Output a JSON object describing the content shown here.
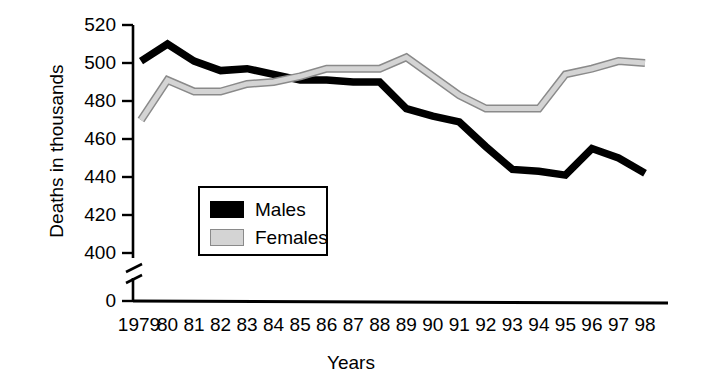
{
  "chart_data": {
    "type": "line",
    "title": "",
    "xlabel": "Years",
    "ylabel": "Deaths in thousands",
    "categories": [
      "1979",
      "80",
      "81",
      "82",
      "83",
      "84",
      "85",
      "86",
      "87",
      "88",
      "89",
      "90",
      "91",
      "92",
      "93",
      "94",
      "95",
      "96",
      "97",
      "98"
    ],
    "yticks": [
      "520",
      "500",
      "480",
      "460",
      "440",
      "420",
      "400",
      "0"
    ],
    "ylim": [
      400,
      520
    ],
    "axis_break": true,
    "axis_break_between": [
      0,
      400
    ],
    "grid": false,
    "legend_position": "inside-lower-left",
    "series": [
      {
        "name": "Males",
        "color": "#000000",
        "style": "solid-thick-black",
        "values": [
          501,
          510,
          501,
          496,
          497,
          494,
          491,
          491,
          490,
          490,
          476,
          472,
          469,
          456,
          444,
          443,
          441,
          455,
          450,
          442
        ]
      },
      {
        "name": "Females",
        "color": "#d4d4d4",
        "style": "outlined-light-gray",
        "values": [
          470,
          491,
          485,
          485,
          489,
          490,
          493,
          497,
          497,
          497,
          503,
          493,
          483,
          476,
          476,
          476,
          494,
          497,
          501,
          500
        ]
      }
    ]
  },
  "legend": {
    "items": [
      {
        "label": "Males",
        "swatch": "males"
      },
      {
        "label": "Females",
        "swatch": "females"
      }
    ]
  },
  "colors": {
    "axis": "#000000",
    "males": "#000000",
    "females_fill": "#d4d4d4",
    "females_stroke": "#8a8a8a",
    "background": "#ffffff"
  }
}
